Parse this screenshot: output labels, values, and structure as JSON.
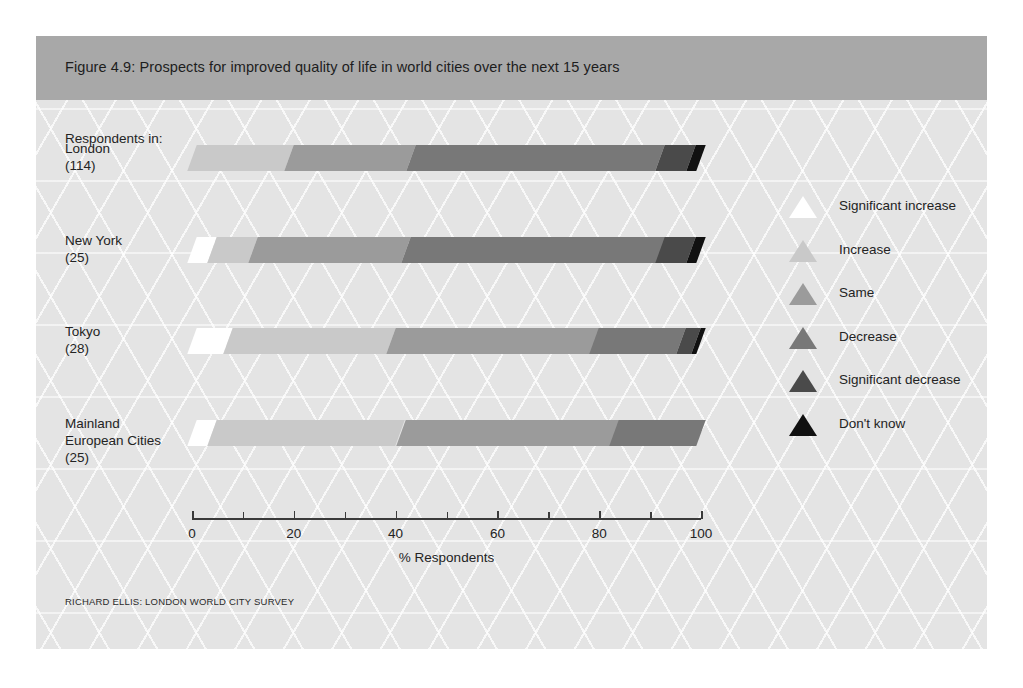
{
  "figure": {
    "title": "Figure 4.9: Prospects for improved quality of life in world cities over the next 15 years",
    "respondents_label": "Respondents in:",
    "source": "RICHARD ELLIS: LONDON WORLD CITY SURVEY",
    "band_color": "#a8a8a8",
    "background_color": "#e4e4e4"
  },
  "chart_data": {
    "type": "bar",
    "orientation": "horizontal",
    "stacked": true,
    "normalized_percent": true,
    "title": "Figure 4.9: Prospects for improved quality of life in world cities over the next 15 years",
    "xlabel": "% Respondents",
    "ylabel": "",
    "xlim": [
      0,
      100
    ],
    "xticks": [
      0,
      20,
      40,
      60,
      80,
      100
    ],
    "xtick_labels": [
      "0",
      "20",
      "40",
      "60",
      "80",
      "100"
    ],
    "minor_ticks": [
      10,
      30,
      50,
      70,
      90
    ],
    "grid": false,
    "legend_position": "right",
    "categories": [
      {
        "name": "London",
        "n": "(114)"
      },
      {
        "name": "New York",
        "n": "(25)"
      },
      {
        "name": "Tokyo",
        "n": "(28)"
      },
      {
        "name": "Mainland European Cities",
        "n": "(25)"
      }
    ],
    "category_labels": [
      "London",
      "New York",
      "Tokyo",
      "Mainland\nEuropean Cities"
    ],
    "series": [
      {
        "name": "Significant increase",
        "color": "#ffffff",
        "values": [
          0,
          4,
          7,
          4
        ]
      },
      {
        "name": "Increase",
        "color": "#c9c9c9",
        "values": [
          19,
          8,
          32,
          37
        ]
      },
      {
        "name": "Same",
        "color": "#9b9b9b",
        "values": [
          24,
          30,
          40,
          42
        ]
      },
      {
        "name": "Decrease",
        "color": "#787878",
        "values": [
          49,
          50,
          17,
          17
        ]
      },
      {
        "name": "Significant decrease",
        "color": "#4a4a4a",
        "values": [
          6,
          6,
          3,
          0
        ]
      },
      {
        "name": "Don't know",
        "color": "#111111",
        "values": [
          2,
          2,
          1,
          0
        ]
      }
    ]
  },
  "legend": {
    "items": [
      {
        "label": "Significant increase",
        "color": "#ffffff"
      },
      {
        "label": "Increase",
        "color": "#c9c9c9"
      },
      {
        "label": "Same",
        "color": "#9b9b9b"
      },
      {
        "label": "Decrease",
        "color": "#787878"
      },
      {
        "label": "Significant decrease",
        "color": "#4a4a4a"
      },
      {
        "label": "Don't know",
        "color": "#111111"
      }
    ]
  }
}
